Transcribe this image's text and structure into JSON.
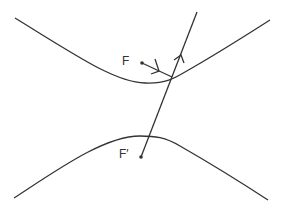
{
  "diagram": {
    "title": "",
    "type": "hyperbola reflection property",
    "labels": {
      "focus_upper": "F",
      "focus_lower": "F′"
    },
    "elements": [
      "upper hyperbola branch",
      "lower hyperbola branch",
      "focus F",
      "focus F′",
      "incident ray from F to branch",
      "reflected ray along line through F′"
    ],
    "colors": {
      "stroke": "#333333",
      "background": "#ffffff"
    }
  }
}
